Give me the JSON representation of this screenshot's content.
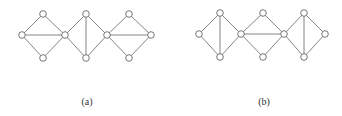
{
  "figures": [
    {
      "id": "a",
      "caption": "(a)",
      "caption_pos": [
        87,
        96
      ],
      "nodes": [
        [
          22,
          35
        ],
        [
          43,
          14
        ],
        [
          43,
          58
        ],
        [
          65,
          35
        ],
        [
          86,
          14
        ],
        [
          86,
          58
        ],
        [
          107,
          35
        ],
        [
          129,
          14
        ],
        [
          129,
          58
        ],
        [
          151,
          35
        ]
      ],
      "edges": [
        [
          0,
          1
        ],
        [
          1,
          3
        ],
        [
          3,
          2
        ],
        [
          2,
          0
        ],
        [
          0,
          3
        ],
        [
          3,
          4
        ],
        [
          4,
          6
        ],
        [
          6,
          5
        ],
        [
          5,
          3
        ],
        [
          4,
          5
        ],
        [
          6,
          7
        ],
        [
          7,
          9
        ],
        [
          9,
          8
        ],
        [
          8,
          6
        ],
        [
          6,
          9
        ]
      ]
    },
    {
      "id": "b",
      "caption": "(b)",
      "caption_pos": [
        264,
        96
      ],
      "nodes": [
        [
          199,
          34
        ],
        [
          220,
          13
        ],
        [
          220,
          57
        ],
        [
          241,
          34
        ],
        [
          263,
          13
        ],
        [
          263,
          57
        ],
        [
          284,
          34
        ],
        [
          304,
          13
        ],
        [
          304,
          57
        ],
        [
          325,
          34
        ]
      ],
      "edges": [
        [
          0,
          1
        ],
        [
          1,
          3
        ],
        [
          3,
          2
        ],
        [
          2,
          0
        ],
        [
          1,
          2
        ],
        [
          3,
          4
        ],
        [
          4,
          6
        ],
        [
          6,
          5
        ],
        [
          5,
          3
        ],
        [
          3,
          6
        ],
        [
          6,
          7
        ],
        [
          7,
          9
        ],
        [
          9,
          8
        ],
        [
          8,
          6
        ],
        [
          7,
          8
        ]
      ]
    }
  ],
  "style": {
    "node_radius": 3.3,
    "edge_color": "#777777",
    "node_stroke": "#666666"
  }
}
